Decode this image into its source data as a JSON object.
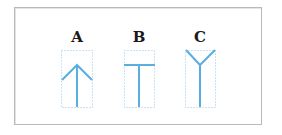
{
  "figure": {
    "panels": [
      {
        "label": "A",
        "shape": "upward-arrow"
      },
      {
        "label": "B",
        "shape": "t-junction"
      },
      {
        "label": "C",
        "shape": "y-fork"
      }
    ],
    "colors": {
      "line": "#5aaee0",
      "dotted_box": "#8fc6ea",
      "frame_border": "#b9b9b9",
      "label_text": "#1a1a1a"
    }
  }
}
